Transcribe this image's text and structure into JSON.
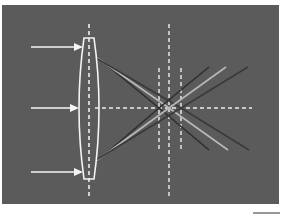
{
  "diagram": {
    "background_color": "#5b5b5b",
    "line_color": "#f2f2f2",
    "ray_colors": {
      "short_focus": "#2e2e2e",
      "middle_focus": "#b8b8b8",
      "long_focus": "#3a3a3a"
    },
    "incoming_rays": [
      {
        "label": "incoming-ray-top",
        "y": 47
      },
      {
        "label": "incoming-ray-middle",
        "y": 108
      },
      {
        "label": "incoming-ray-bottom",
        "y": 172
      }
    ],
    "focal_lines": [
      {
        "label": "focal-line-near",
        "x": 159
      },
      {
        "label": "focal-line-center",
        "x": 169
      },
      {
        "label": "focal-line-far",
        "x": 181
      }
    ]
  }
}
